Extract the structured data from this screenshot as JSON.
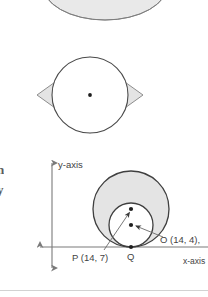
{
  "page": {
    "width": 208,
    "height": 297,
    "background": "#ffffff",
    "rule_color": "#d2d2d2"
  },
  "style": {
    "shade_fill": "#e4e4e4",
    "shade_fill_light": "#ececec",
    "stroke_dark": "#3c3c3c",
    "stroke_mid": "#6e6e6e",
    "stroke_light": "#9a9a9a",
    "axis_color": "#7a7a7a",
    "text_color": "#434343",
    "dot_color": "#1e1e1e"
  },
  "edge_fragments": [
    {
      "name": "clipped-text-fragment-1",
      "text": "n",
      "x": 0,
      "y": 163
    },
    {
      "name": "clipped-text-fragment-2",
      "text": "y",
      "x": 0,
      "y": 183
    }
  ],
  "figures": [
    {
      "id": "annulus-figure",
      "caption_text": "",
      "description": "annulus ring cropped at top of page",
      "shapes": {
        "outer_cx": 105,
        "outer_cy": -16,
        "outer_rx": 63,
        "outer_ry": 36,
        "inner_cx": 105,
        "inner_cy": -20,
        "inner_rx": 33,
        "inner_ry": 19
      }
    },
    {
      "id": "rhombus-incircle-figure",
      "description": "rhombus with inscribed circle and marked centre",
      "shapes": {
        "rhombus_points": "37,95 90,57 143,95 90,133",
        "circle_cx": 90,
        "circle_cy": 95,
        "circle_r": 38,
        "center_dot_x": 90,
        "center_dot_y": 95
      }
    },
    {
      "id": "tangent-circles-axes-figure",
      "description": "two internally tangent circles on coordinate axes",
      "axes": {
        "y_axis_x": 52,
        "y_axis_top": 157,
        "y_axis_bottom": 274,
        "x_axis_y": 247,
        "x_axis_left": 34,
        "x_axis_right": 208
      },
      "shapes": {
        "big_circle_cx": 131,
        "big_circle_cy": 209,
        "big_circle_r": 38,
        "small_circle_cx": 131,
        "small_circle_cy": 225,
        "small_circle_r": 22,
        "tangent_point_x": 131,
        "tangent_point_y": 247,
        "dot_p_x": 131,
        "dot_p_y": 209,
        "dot_o_x": 131,
        "dot_o_y": 225
      },
      "leaders": [
        {
          "name": "leader-line-p",
          "x1": 104,
          "y1": 250,
          "x2": 129,
          "y2": 212
        },
        {
          "name": "leader-line-o",
          "x1": 162,
          "y1": 237,
          "x2": 135,
          "y2": 226
        }
      ],
      "labels": [
        {
          "name": "label-y-axis",
          "text": "y-axis",
          "x": 58,
          "y": 160,
          "size": "normal"
        },
        {
          "name": "label-x-axis",
          "text": "x-axis",
          "x": 183,
          "y": 257,
          "size": "small"
        },
        {
          "name": "label-point-p",
          "text": "P (14, 7)",
          "x": 72,
          "y": 253,
          "size": "normal"
        },
        {
          "name": "label-point-q",
          "text": "Q",
          "x": 127,
          "y": 252,
          "size": "normal"
        },
        {
          "name": "label-point-o",
          "text": "O (14, 4),",
          "x": 160,
          "y": 235,
          "size": "normal"
        }
      ]
    }
  ]
}
